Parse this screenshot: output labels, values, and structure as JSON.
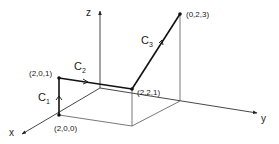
{
  "diagram": {
    "axes": {
      "x": "x",
      "y": "y",
      "z": "z"
    },
    "points": [
      {
        "label": "(2,0,0)"
      },
      {
        "label": "(2,0,1)"
      },
      {
        "label": "(2,2,1)"
      },
      {
        "label": "(0,2,3)"
      }
    ],
    "curves": [
      {
        "name": "C",
        "sub": "1"
      },
      {
        "name": "C",
        "sub": "2"
      },
      {
        "name": "C",
        "sub": "3"
      }
    ],
    "colors": {
      "path": "#111111",
      "axis": "#333333",
      "box": "#555555"
    }
  }
}
